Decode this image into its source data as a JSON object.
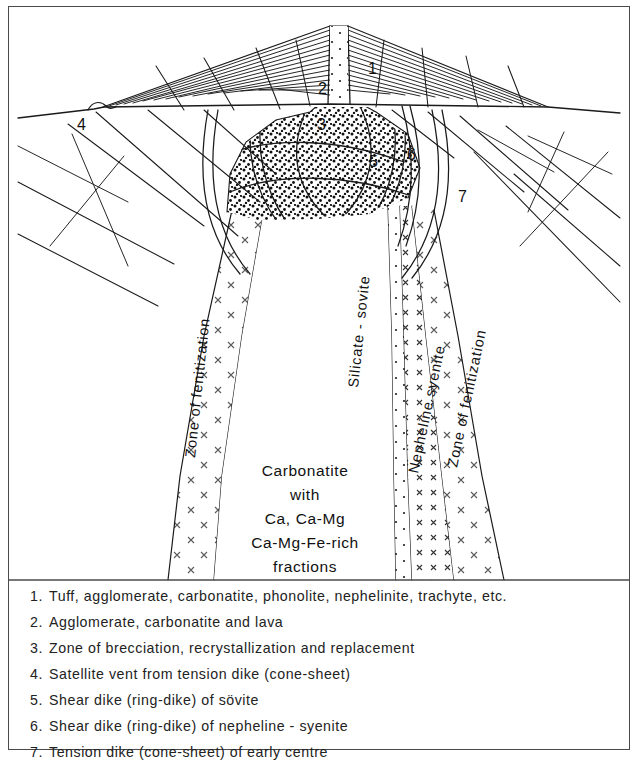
{
  "figure": {
    "title_present": false,
    "frame_color": "#4a4a4a",
    "background": "#ffffff",
    "ink_color": "#1a1a1a"
  },
  "diagram": {
    "type": "geological-cross-section",
    "callouts": [
      {
        "id": "1",
        "label": "1",
        "x": 368,
        "y": 70
      },
      {
        "id": "2",
        "label": "2",
        "x": 318,
        "y": 90
      },
      {
        "id": "3",
        "label": "3",
        "x": 317,
        "y": 126
      },
      {
        "id": "4",
        "label": "4",
        "x": 77,
        "y": 126
      },
      {
        "id": "5",
        "label": "5",
        "x": 369,
        "y": 163
      },
      {
        "id": "6",
        "label": "6",
        "x": 407,
        "y": 156
      },
      {
        "id": "7",
        "label": "7",
        "x": 458,
        "y": 198
      }
    ],
    "rotated_labels": [
      {
        "name": "zone-of-fenitization-left",
        "text": "Zone of fenitization",
        "x": 190,
        "y": 388,
        "rotate": -84
      },
      {
        "name": "silicate-sovite",
        "text": "Silicate - sovite",
        "x": 352,
        "y": 320,
        "rotate": -84
      },
      {
        "name": "nepheline-syenite",
        "text": "Nepheline syenite",
        "x": 412,
        "y": 400,
        "rotate": -76
      },
      {
        "name": "zone-of-fenitization-right",
        "text": "Zone of fenitization",
        "x": 452,
        "y": 390,
        "rotate": -76
      }
    ],
    "core_block": {
      "name": "carbonatite-core-label",
      "lines": [
        "Carbonatite",
        "with",
        "Ca, Ca-Mg",
        "Ca-Mg-Fe-rich",
        "fractions"
      ],
      "x": 305,
      "y": 470
    }
  },
  "legend": {
    "items": [
      {
        "num": "1.",
        "text": "Tuff, agglomerate, carbonatite, phonolite, nephelinite, trachyte, etc."
      },
      {
        "num": "2.",
        "text": "Agglomerate, carbonatite and lava"
      },
      {
        "num": "3.",
        "text": "Zone of brecciation, recrystallization and replacement"
      },
      {
        "num": "4.",
        "text": "Satellite vent from tension dike (cone-sheet)"
      },
      {
        "num": "5.",
        "text": "Shear dike (ring-dike) of sövite"
      },
      {
        "num": "6.",
        "text": "Shear dike (ring-dike) of nepheline - syenite"
      },
      {
        "num": "7.",
        "text": "Tension dike (cone-sheet) of early centre"
      }
    ]
  }
}
